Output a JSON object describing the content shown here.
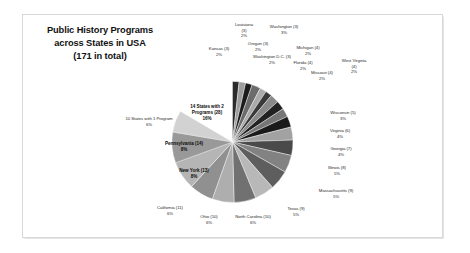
{
  "chart_data": {
    "type": "pie",
    "title": "Public History Programs\nacross States in USA\n(171 in total)",
    "title_lines": [
      "Public History Programs",
      "across States in USA",
      "(171 in total)"
    ],
    "total": 171,
    "total_label": "171 in total",
    "legend": "none",
    "grid": false,
    "xlabel": "",
    "ylabel": "",
    "palette": [
      "#333333",
      "#9a9a9a",
      "#c9c9c9",
      "#6e6e6e",
      "#b3b3b3",
      "#1f1f1f",
      "#8a8a8a"
    ],
    "categories": [
      "14 States with 2 Programs (28)",
      "Louisiana (3)",
      "Washington (3)",
      "Oregon (3)",
      "Kansas (3)",
      "Washington D.C. (3)",
      "Michigan (4)",
      "Florida (4)",
      "Missouri (4)",
      "West Virginia (4)",
      "Wisconsin (5)",
      "Virginia (6)",
      "Georgia (7)",
      "Illinois (8)",
      "Massachusetts (9)",
      "Texas (9)",
      "North Carolina (10)",
      "Ohio (10)",
      "California (11)",
      "New York (13)",
      "Pennsylvania (14)",
      "10 States with 1 Program"
    ],
    "values": [
      28,
      3,
      3,
      3,
      3,
      3,
      4,
      4,
      4,
      4,
      5,
      6,
      7,
      8,
      9,
      9,
      10,
      10,
      11,
      13,
      14,
      10
    ],
    "percents": [
      "16%",
      "2%",
      "2%",
      "2%",
      "2%",
      "2%",
      "2%",
      "2%",
      "2%",
      "2%",
      "3%",
      "4%",
      "4%",
      "5%",
      "5%",
      "5%",
      "6%",
      "6%",
      "6%",
      "8%",
      "8%",
      "6%"
    ],
    "slices": [
      {
        "name": "14 States with 2 Programs (28)",
        "label": "14 States with 2\nPrograms (28)\n16%",
        "value": 28,
        "percent": "16%",
        "color": "#8e8e8e",
        "start": 236.0,
        "sweep": 58.9,
        "label_x": 207,
        "label_y": 113,
        "inside": true
      },
      {
        "name": "Louisiana (3)",
        "label": "Louisiana\n(3)\n2%",
        "value": 3,
        "percent": "2%",
        "color": "#2b2b2b",
        "start": 0.0,
        "sweep": 6.3,
        "label_x": 244,
        "label_y": 30,
        "inside": false
      },
      {
        "name": "Washington (3)",
        "label": "Washington (3)\n3%",
        "value": 3,
        "percent": "3%",
        "color": "#9d9d9d",
        "start": 6.3,
        "sweep": 6.3,
        "label_x": 284,
        "label_y": 30,
        "inside": false
      },
      {
        "name": "Oregon (3)",
        "label": "Oregon (3)\n2%",
        "value": 3,
        "percent": "2%",
        "color": "#1c1c1c",
        "start": 12.6,
        "sweep": 6.3,
        "label_x": 258,
        "label_y": 47,
        "inside": false
      },
      {
        "name": "Michigan (4)",
        "label": "Michigan (4)\n2%",
        "value": 4,
        "percent": "2%",
        "color": "#6b6b6b",
        "start": 18.9,
        "sweep": 8.4,
        "label_x": 308,
        "label_y": 51,
        "inside": false
      },
      {
        "name": "Kansas (3)",
        "label": "Kansas (3)\n2%",
        "value": 3,
        "percent": "2%",
        "color": "#ababab",
        "start": 27.3,
        "sweep": 6.3,
        "label_x": 219,
        "label_y": 52,
        "inside": false
      },
      {
        "name": "Washington D.C. (3)",
        "label": "Washington D.C. (3)\n2%",
        "value": 3,
        "percent": "2%",
        "color": "#3a3a3a",
        "start": 33.6,
        "sweep": 6.3,
        "label_x": 272,
        "label_y": 60,
        "inside": false
      },
      {
        "name": "Florida (4)",
        "label": "Florida (4)\n2%",
        "value": 4,
        "percent": "2%",
        "color": "#8a8a8a",
        "start": 39.9,
        "sweep": 8.4,
        "label_x": 303,
        "label_y": 66,
        "inside": false
      },
      {
        "name": "West Virginia (4)",
        "label": "West Virginia\n(4)\n2%",
        "value": 4,
        "percent": "2%",
        "color": "#222222",
        "start": 48.3,
        "sweep": 8.4,
        "label_x": 354,
        "label_y": 66,
        "inside": false
      },
      {
        "name": "Missouri (4)",
        "label": "Missouri (4)\n2%",
        "value": 4,
        "percent": "2%",
        "color": "#767676",
        "start": 56.7,
        "sweep": 8.4,
        "label_x": 322,
        "label_y": 76,
        "inside": false
      },
      {
        "name": "Wisconsin (5)",
        "label": "Wisconsin (5)\n3%",
        "value": 5,
        "percent": "3%",
        "color": "#1a1a1a",
        "start": 65.1,
        "sweep": 10.5,
        "label_x": 343,
        "label_y": 116,
        "inside": false
      },
      {
        "name": "Virginia (6)",
        "label": "Virginia (6)\n4%",
        "value": 6,
        "percent": "4%",
        "color": "#a2a2a2",
        "start": 75.6,
        "sweep": 12.6,
        "label_x": 340,
        "label_y": 134,
        "inside": false
      },
      {
        "name": "Georgia (7)",
        "label": "Georgia (7)\n4%",
        "value": 7,
        "percent": "4%",
        "color": "#4a4a4a",
        "start": 88.2,
        "sweep": 14.7,
        "label_x": 341,
        "label_y": 152,
        "inside": false
      },
      {
        "name": "Illinois (8)",
        "label": "Illinois (8)\n5%",
        "value": 8,
        "percent": "5%",
        "color": "#828282",
        "start": 102.9,
        "sweep": 16.8,
        "label_x": 337,
        "label_y": 171,
        "inside": false
      },
      {
        "name": "Massachusetts (9)",
        "label": "Massachusetts (9)\n5%",
        "value": 9,
        "percent": "5%",
        "color": "#5e5e5e",
        "start": 119.7,
        "sweep": 18.9,
        "label_x": 336,
        "label_y": 194,
        "inside": false
      },
      {
        "name": "Texas (9)",
        "label": "Texas (9)\n5%",
        "value": 9,
        "percent": "5%",
        "color": "#b8b8b8",
        "start": 138.6,
        "sweep": 18.9,
        "label_x": 296,
        "label_y": 212,
        "inside": false
      },
      {
        "name": "North Carolina (10)",
        "label": "North Carolina (10)\n6%",
        "value": 10,
        "percent": "6%",
        "color": "#717171",
        "start": 157.5,
        "sweep": 21.0,
        "label_x": 253,
        "label_y": 220,
        "inside": false
      },
      {
        "name": "Ohio (10)",
        "label": "Ohio (10)\n6%",
        "value": 10,
        "percent": "6%",
        "color": "#aeaeae",
        "start": 178.5,
        "sweep": 21.0,
        "label_x": 209,
        "label_y": 220,
        "inside": false
      },
      {
        "name": "California (11)",
        "label": "California (11)\n6%",
        "value": 11,
        "percent": "6%",
        "color": "#909090",
        "start": 199.5,
        "sweep": 23.1,
        "label_x": 170,
        "label_y": 211,
        "inside": false
      },
      {
        "name": "New York (13)",
        "label": "New York (13)\n8%",
        "value": 13,
        "percent": "8%",
        "color": "#b5b5b5",
        "start": 222.6,
        "sweep": 27.4,
        "label_x": 194,
        "label_y": 174,
        "inside": true
      },
      {
        "name": "Pennsylvania (14)",
        "label": "Pennsylvania (14)\n8%",
        "value": 14,
        "percent": "8%",
        "color": "#999999",
        "start": 250.0,
        "sweep": 29.5,
        "label_x": 184,
        "label_y": 147,
        "inside": true
      },
      {
        "name": "10 States with 1 Program",
        "label": "10 States with 1 Program\n6%",
        "value": 10,
        "percent": "6%",
        "color": "#d2d2d2",
        "start": 279.5,
        "sweep": 21.0,
        "label_x": 149,
        "label_y": 122,
        "inside": false
      }
    ]
  }
}
